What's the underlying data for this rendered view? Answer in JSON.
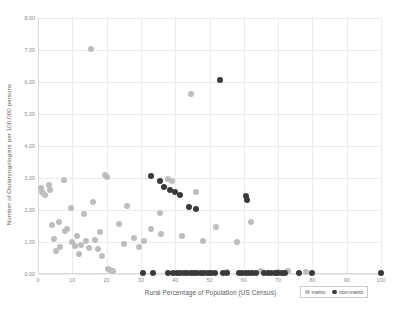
{
  "chart_data": {
    "type": "scatter",
    "title": "",
    "xlabel": "Rural Percentage of Population (US Census)",
    "ylabel": "Number of Otolaryngologists per 100,000 persons",
    "xlim": [
      0,
      100
    ],
    "ylim": [
      0,
      8
    ],
    "grid": true,
    "xticks": [
      0,
      10,
      20,
      30,
      40,
      50,
      60,
      70,
      80,
      90,
      100
    ],
    "xticklabels": [
      "0",
      "10",
      "20",
      "30",
      "40",
      "50",
      "60",
      "70",
      "80",
      "90",
      "100"
    ],
    "yticks": [
      0,
      1,
      2,
      3,
      4,
      5,
      6,
      7,
      8
    ],
    "yticklabels": [
      "0.00",
      "1.00",
      "2.00",
      "3.00",
      "4.00",
      "5.00",
      "6.00",
      "7.00",
      "8.00"
    ],
    "legend_position": "bottom-right",
    "colors": {
      "metro": "#bdbdbd",
      "non-metro": "#3a3a3a",
      "gridline": "#ebebeb",
      "axis": "#d9d9d9",
      "text": "#5b5b5b",
      "tick": "#8c8c8c"
    },
    "series": [
      {
        "name": "metro",
        "color": "#bdbdbd",
        "points": [
          [
            0.8,
            2.7
          ],
          [
            1.2,
            2.55
          ],
          [
            1.5,
            2.52
          ],
          [
            2.0,
            2.48
          ],
          [
            3.2,
            2.78
          ],
          [
            3.5,
            2.62
          ],
          [
            4.0,
            1.52
          ],
          [
            4.6,
            1.1
          ],
          [
            5.2,
            0.72
          ],
          [
            6.0,
            1.62
          ],
          [
            6.4,
            0.85
          ],
          [
            7.5,
            2.95
          ],
          [
            8.0,
            1.35
          ],
          [
            8.6,
            1.42
          ],
          [
            9.5,
            2.05
          ],
          [
            10.0,
            1.0
          ],
          [
            10.8,
            0.88
          ],
          [
            11.5,
            1.18
          ],
          [
            12.0,
            0.62
          ],
          [
            12.6,
            0.92
          ],
          [
            13.5,
            1.88
          ],
          [
            14.0,
            1.02
          ],
          [
            14.8,
            0.8
          ],
          [
            15.5,
            7.02
          ],
          [
            16.0,
            2.25
          ],
          [
            16.5,
            1.05
          ],
          [
            17.5,
            0.78
          ],
          [
            18.0,
            1.3
          ],
          [
            18.8,
            0.55
          ],
          [
            19.5,
            3.08
          ],
          [
            20.0,
            3.02
          ],
          [
            20.5,
            0.15
          ],
          [
            21.0,
            0.12
          ],
          [
            21.5,
            0.1
          ],
          [
            22.0,
            0.08
          ],
          [
            23.5,
            1.55
          ],
          [
            25.0,
            0.95
          ],
          [
            26.0,
            2.12
          ],
          [
            28.0,
            1.12
          ],
          [
            29.5,
            0.85
          ],
          [
            31.0,
            1.02
          ],
          [
            33.0,
            1.4
          ],
          [
            35.5,
            1.92
          ],
          [
            36.0,
            1.25
          ],
          [
            38.0,
            2.98
          ],
          [
            39.0,
            2.92
          ],
          [
            42.0,
            1.18
          ],
          [
            44.5,
            5.62
          ],
          [
            46.0,
            2.55
          ],
          [
            48.0,
            1.02
          ],
          [
            52.0,
            1.48
          ],
          [
            55.0,
            0.05
          ],
          [
            58.0,
            1.0
          ],
          [
            62.0,
            1.62
          ],
          [
            65.0,
            0.08
          ],
          [
            70.0,
            0.05
          ],
          [
            73.0,
            0.1
          ],
          [
            78.0,
            0.05
          ]
        ]
      },
      {
        "name": "non-metro",
        "color": "#3a3a3a",
        "points": [
          [
            33.0,
            3.05
          ],
          [
            35.5,
            2.92
          ],
          [
            36.8,
            2.72
          ],
          [
            38.5,
            2.62
          ],
          [
            40.0,
            2.55
          ],
          [
            41.5,
            2.48
          ],
          [
            44.0,
            2.08
          ],
          [
            46.0,
            2.02
          ],
          [
            53.0,
            6.05
          ],
          [
            60.5,
            2.45
          ],
          [
            61.0,
            2.32
          ],
          [
            30.5,
            0.04
          ],
          [
            33.5,
            0.04
          ],
          [
            38.0,
            0.04
          ],
          [
            39.5,
            0.04
          ],
          [
            40.5,
            0.04
          ],
          [
            41.5,
            0.04
          ],
          [
            42.5,
            0.04
          ],
          [
            43.5,
            0.04
          ],
          [
            44.5,
            0.04
          ],
          [
            45.5,
            0.04
          ],
          [
            46.5,
            0.04
          ],
          [
            47.5,
            0.04
          ],
          [
            48.5,
            0.04
          ],
          [
            49.5,
            0.04
          ],
          [
            50.5,
            0.04
          ],
          [
            51.5,
            0.04
          ],
          [
            54.0,
            0.04
          ],
          [
            55.0,
            0.04
          ],
          [
            58.5,
            0.04
          ],
          [
            59.5,
            0.04
          ],
          [
            60.5,
            0.04
          ],
          [
            61.5,
            0.04
          ],
          [
            62.5,
            0.04
          ],
          [
            63.5,
            0.04
          ],
          [
            66.0,
            0.04
          ],
          [
            67.0,
            0.04
          ],
          [
            68.0,
            0.04
          ],
          [
            69.0,
            0.04
          ],
          [
            70.0,
            0.04
          ],
          [
            71.0,
            0.04
          ],
          [
            72.0,
            0.04
          ],
          [
            76.0,
            0.04
          ],
          [
            80.0,
            0.04
          ],
          [
            100.0,
            0.04
          ]
        ]
      }
    ]
  },
  "legend": {
    "entries": [
      {
        "label": "metro",
        "key": "metro"
      },
      {
        "label": "non-metro",
        "key": "non-metro"
      }
    ]
  }
}
